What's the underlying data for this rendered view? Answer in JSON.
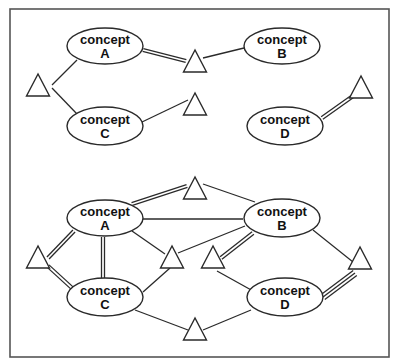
{
  "diagram": {
    "title": "",
    "frame": {
      "x": 10,
      "y": 9,
      "width": 379,
      "height": 348
    },
    "colors": {
      "stroke": "#2a2a2a",
      "frame": "#555555",
      "background": "#ffffff",
      "text": "#111111"
    },
    "panels": [
      {
        "id": "top",
        "concepts": [
          {
            "id": "A",
            "line1": "concept",
            "line2": "A",
            "cx": 105,
            "cy": 46,
            "rx": 38,
            "ry": 18
          },
          {
            "id": "B",
            "line1": "concept",
            "line2": "B",
            "cx": 282,
            "cy": 46,
            "rx": 38,
            "ry": 18
          },
          {
            "id": "C",
            "line1": "concept",
            "line2": "C",
            "cx": 105,
            "cy": 126,
            "rx": 38,
            "ry": 19
          },
          {
            "id": "D",
            "line1": "concept",
            "line2": "D",
            "cx": 285,
            "cy": 126,
            "rx": 38,
            "ry": 19
          }
        ],
        "relations": [
          {
            "id": "t1",
            "x": 38,
            "y": 74
          },
          {
            "id": "t2",
            "x": 195,
            "y": 50
          },
          {
            "id": "t3",
            "x": 195,
            "y": 93
          },
          {
            "id": "t4",
            "x": 361,
            "y": 76
          }
        ],
        "edges": [
          {
            "from": [
              52,
              85
            ],
            "to": [
              77,
              60
            ],
            "lines": 1
          },
          {
            "from": [
              52,
              88
            ],
            "to": [
              77,
              114
            ],
            "lines": 1
          },
          {
            "from": [
              143,
              50
            ],
            "to": [
              186,
              61
            ],
            "lines": 2
          },
          {
            "from": [
              203,
              58
            ],
            "to": [
              244,
              48
            ],
            "lines": 1
          },
          {
            "from": [
              142,
              122
            ],
            "to": [
              188,
              100
            ],
            "lines": 1
          },
          {
            "from": [
              322,
              118
            ],
            "to": [
              353,
              96
            ],
            "lines": 2
          }
        ]
      },
      {
        "id": "bottom",
        "concepts": [
          {
            "id": "A",
            "line1": "concept",
            "line2": "A",
            "cx": 105,
            "cy": 218,
            "rx": 38,
            "ry": 18
          },
          {
            "id": "B",
            "line1": "concept",
            "line2": "B",
            "cx": 282,
            "cy": 218,
            "rx": 38,
            "ry": 19
          },
          {
            "id": "C",
            "line1": "concept",
            "line2": "C",
            "cx": 105,
            "cy": 297,
            "rx": 38,
            "ry": 19
          },
          {
            "id": "D",
            "line1": "concept",
            "line2": "D",
            "cx": 285,
            "cy": 297,
            "rx": 38,
            "ry": 19
          }
        ],
        "relations": [
          {
            "id": "t1",
            "x": 38,
            "y": 246
          },
          {
            "id": "t2",
            "x": 195,
            "y": 177
          },
          {
            "id": "t3",
            "x": 172,
            "y": 246
          },
          {
            "id": "t4",
            "x": 213,
            "y": 246
          },
          {
            "id": "t5",
            "x": 360,
            "y": 247
          },
          {
            "id": "t6",
            "x": 195,
            "y": 318
          }
        ],
        "edges": [
          {
            "from": [
              132,
              204
            ],
            "to": [
              187,
              186
            ],
            "lines": 2
          },
          {
            "from": [
              143,
              219
            ],
            "to": [
              243,
              219
            ],
            "lines": 1
          },
          {
            "from": [
              203,
              184
            ],
            "to": [
              255,
              202
            ],
            "lines": 1
          },
          {
            "from": [
              74,
              231
            ],
            "to": [
              48,
              258
            ],
            "lines": 2
          },
          {
            "from": [
              48,
              266
            ],
            "to": [
              72,
              288
            ],
            "lines": 2
          },
          {
            "from": [
              103,
              237
            ],
            "to": [
              103,
              278
            ],
            "lines": 2
          },
          {
            "from": [
              132,
              231
            ],
            "to": [
              165,
              254
            ],
            "lines": 1
          },
          {
            "from": [
              178,
              253
            ],
            "to": [
              245,
              226
            ],
            "lines": 1
          },
          {
            "from": [
              143,
              292
            ],
            "to": [
              170,
              268
            ],
            "lines": 1
          },
          {
            "from": [
              253,
              233
            ],
            "to": [
              221,
              258
            ],
            "lines": 2
          },
          {
            "from": [
              217,
              271
            ],
            "to": [
              253,
              291
            ],
            "lines": 1
          },
          {
            "from": [
              313,
              230
            ],
            "to": [
              353,
              262
            ],
            "lines": 1
          },
          {
            "from": [
              323,
              297
            ],
            "to": [
              355,
              273
            ],
            "lines": 3
          },
          {
            "from": [
              135,
              310
            ],
            "to": [
              188,
              330
            ],
            "lines": 1
          },
          {
            "from": [
              203,
              330
            ],
            "to": [
              251,
              310
            ],
            "lines": 1
          }
        ]
      }
    ]
  }
}
